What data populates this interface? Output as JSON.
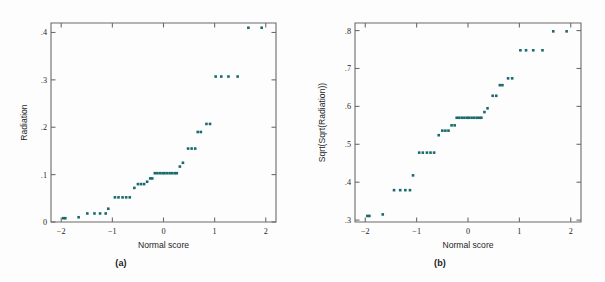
{
  "figure": {
    "background_color": "#fdfdfd",
    "frame_color": "#6b6b6b",
    "point_color": "#186a6e",
    "text_color": "#1d1d1d"
  },
  "panels": [
    {
      "id": "a",
      "subcaption": "(a)",
      "xlabel": "Normal score",
      "ylabel": "Radiation",
      "xticklabels": [
        "−2",
        "−1",
        "0",
        "1",
        "2"
      ],
      "yticklabels": [
        "0",
        ".1",
        ".2",
        ".3",
        ".4"
      ]
    },
    {
      "id": "b",
      "subcaption": "(b)",
      "xlabel": "Normal score",
      "ylabel": "Sqrt(Sqrt(Radiation))",
      "xticklabels": [
        "−2",
        "−1",
        "0",
        "1",
        "2"
      ],
      "yticklabels": [
        ".3",
        ".4",
        ".5",
        ".6",
        ".7",
        ".8"
      ]
    }
  ],
  "chart_data": [
    {
      "type": "scatter",
      "panel": "a",
      "title": "",
      "xlabel": "Normal score",
      "ylabel": "Radiation",
      "xlim": [
        -2.2,
        2.2
      ],
      "ylim": [
        0.0,
        0.42
      ],
      "xticks": [
        -2,
        -1,
        0,
        1,
        2
      ],
      "yticks": [
        0,
        0.1,
        0.2,
        0.3,
        0.4
      ],
      "grid": false,
      "legend": "none",
      "n_points": 42,
      "x": [
        -1.96,
        -1.92,
        -1.66,
        -1.49,
        -1.35,
        -1.24,
        -1.13,
        -1.08,
        -0.95,
        -0.88,
        -0.8,
        -0.73,
        -0.66,
        -0.57,
        -0.5,
        -0.44,
        -0.38,
        -0.32,
        -0.26,
        -0.22,
        -0.17,
        -0.12,
        -0.07,
        -0.02,
        0.02,
        0.07,
        0.12,
        0.17,
        0.22,
        0.26,
        0.32,
        0.38,
        0.5,
        0.55,
        0.62,
        0.67,
        0.8,
        0.86,
        1.02,
        1.13,
        1.27,
        1.45,
        1.66,
        1.92
      ],
      "y": [
        0.008,
        0.008,
        0.01,
        0.018,
        0.018,
        0.018,
        0.018,
        0.028,
        0.052,
        0.052,
        0.052,
        0.052,
        0.052,
        0.072,
        0.08,
        0.08,
        0.08,
        0.085,
        0.092,
        0.092,
        0.103,
        0.103,
        0.103,
        0.103,
        0.103,
        0.103,
        0.103,
        0.103,
        0.103,
        0.103,
        0.117,
        0.125,
        0.155,
        0.155,
        0.155,
        0.19,
        0.19,
        0.207,
        0.207,
        0.207,
        0.307,
        0.307,
        0.307,
        0.307,
        0.41,
        0.41
      ],
      "points": [
        [
          -1.96,
          0.008
        ],
        [
          -1.92,
          0.008
        ],
        [
          -1.66,
          0.01
        ],
        [
          -1.49,
          0.018
        ],
        [
          -1.35,
          0.018
        ],
        [
          -1.24,
          0.018
        ],
        [
          -1.13,
          0.018
        ],
        [
          -1.08,
          0.028
        ],
        [
          -0.95,
          0.052
        ],
        [
          -0.88,
          0.052
        ],
        [
          -0.8,
          0.052
        ],
        [
          -0.73,
          0.052
        ],
        [
          -0.66,
          0.052
        ],
        [
          -0.57,
          0.072
        ],
        [
          -0.5,
          0.08
        ],
        [
          -0.44,
          0.08
        ],
        [
          -0.38,
          0.08
        ],
        [
          -0.32,
          0.085
        ],
        [
          -0.26,
          0.092
        ],
        [
          -0.22,
          0.092
        ],
        [
          -0.17,
          0.103
        ],
        [
          -0.12,
          0.103
        ],
        [
          -0.07,
          0.103
        ],
        [
          -0.02,
          0.103
        ],
        [
          0.02,
          0.103
        ],
        [
          0.07,
          0.103
        ],
        [
          0.12,
          0.103
        ],
        [
          0.17,
          0.103
        ],
        [
          0.22,
          0.103
        ],
        [
          0.26,
          0.103
        ],
        [
          0.32,
          0.117
        ],
        [
          0.38,
          0.125
        ],
        [
          0.48,
          0.155
        ],
        [
          0.55,
          0.155
        ],
        [
          0.62,
          0.155
        ],
        [
          0.67,
          0.19
        ],
        [
          0.73,
          0.19
        ],
        [
          0.84,
          0.207
        ],
        [
          0.91,
          0.207
        ],
        [
          1.02,
          0.307
        ],
        [
          1.13,
          0.307
        ],
        [
          1.27,
          0.307
        ],
        [
          1.45,
          0.307
        ],
        [
          1.66,
          0.41
        ],
        [
          1.92,
          0.41
        ]
      ]
    },
    {
      "type": "scatter",
      "panel": "b",
      "title": "",
      "xlabel": "Normal score",
      "ylabel": "Sqrt(Sqrt(Radiation))",
      "xlim": [
        -2.2,
        2.2
      ],
      "ylim": [
        0.295,
        0.82
      ],
      "xticks": [
        -2,
        -1,
        0,
        1,
        2
      ],
      "yticks": [
        0.3,
        0.4,
        0.5,
        0.6,
        0.7,
        0.8
      ],
      "grid": false,
      "legend": "none",
      "n_points": 42,
      "points": [
        [
          -1.96,
          0.311
        ],
        [
          -1.92,
          0.311
        ],
        [
          -1.66,
          0.315
        ],
        [
          -1.44,
          0.379
        ],
        [
          -1.32,
          0.379
        ],
        [
          -1.22,
          0.379
        ],
        [
          -1.13,
          0.379
        ],
        [
          -1.07,
          0.418
        ],
        [
          -0.95,
          0.478
        ],
        [
          -0.88,
          0.478
        ],
        [
          -0.8,
          0.478
        ],
        [
          -0.73,
          0.478
        ],
        [
          -0.66,
          0.478
        ],
        [
          -0.57,
          0.524
        ],
        [
          -0.5,
          0.536
        ],
        [
          -0.44,
          0.536
        ],
        [
          -0.38,
          0.536
        ],
        [
          -0.32,
          0.55
        ],
        [
          -0.26,
          0.55
        ],
        [
          -0.22,
          0.57
        ],
        [
          -0.17,
          0.57
        ],
        [
          -0.12,
          0.57
        ],
        [
          -0.07,
          0.57
        ],
        [
          -0.02,
          0.57
        ],
        [
          0.02,
          0.57
        ],
        [
          0.07,
          0.57
        ],
        [
          0.12,
          0.57
        ],
        [
          0.17,
          0.57
        ],
        [
          0.22,
          0.57
        ],
        [
          0.26,
          0.57
        ],
        [
          0.32,
          0.585
        ],
        [
          0.38,
          0.595
        ],
        [
          0.48,
          0.628
        ],
        [
          0.55,
          0.628
        ],
        [
          0.62,
          0.656
        ],
        [
          0.67,
          0.656
        ],
        [
          0.78,
          0.674
        ],
        [
          0.86,
          0.674
        ],
        [
          1.02,
          0.748
        ],
        [
          1.13,
          0.748
        ],
        [
          1.27,
          0.748
        ],
        [
          1.45,
          0.748
        ],
        [
          1.66,
          0.798
        ],
        [
          1.92,
          0.798
        ]
      ]
    }
  ]
}
